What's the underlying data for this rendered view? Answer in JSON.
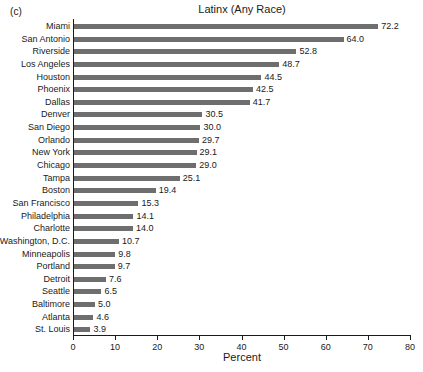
{
  "figure": {
    "panel_label": "(c)",
    "x_axis_title": "Percent"
  },
  "chart_data": {
    "type": "bar",
    "orientation": "horizontal",
    "title": "Latinx (Any Race)",
    "xlabel": "Percent",
    "ylabel": "",
    "xlim": [
      0,
      80
    ],
    "xticks": [
      0,
      10,
      20,
      30,
      40,
      50,
      60,
      70,
      80
    ],
    "xtick_labels": [
      "0",
      "10",
      "20",
      "30",
      "40",
      "50",
      "60",
      "70",
      "80"
    ],
    "grid": false,
    "legend": null,
    "bar_color": "#6e6e6e",
    "value_label_format": "one-decimal",
    "categories": [
      "Miami",
      "San Antonio",
      "Riverside",
      "Los Angeles",
      "Houston",
      "Phoenix",
      "Dallas",
      "Denver",
      "San Diego",
      "Orlando",
      "New York",
      "Chicago",
      "Tampa",
      "Boston",
      "San Francisco",
      "Philadelphia",
      "Charlotte",
      "Washington, D.C.",
      "Minneapolis",
      "Portland",
      "Detroit",
      "Seattle",
      "Baltimore",
      "Atlanta",
      "St. Louis"
    ],
    "values": [
      72.2,
      64.0,
      52.8,
      48.7,
      44.5,
      42.5,
      41.7,
      30.5,
      30.0,
      29.7,
      29.1,
      29.0,
      25.1,
      19.4,
      15.3,
      14.1,
      14.0,
      10.7,
      9.8,
      9.7,
      7.6,
      6.5,
      5.0,
      4.6,
      3.9
    ],
    "value_labels": [
      "72.2",
      "64.0",
      "52.8",
      "48.7",
      "44.5",
      "42.5",
      "41.7",
      "30.5",
      "30.0",
      "29.7",
      "29.1",
      "29.0",
      "25.1",
      "19.4",
      "15.3",
      "14.1",
      "14.0",
      "10.7",
      "9.8",
      "9.7",
      "7.6",
      "6.5",
      "5.0",
      "4.6",
      "3.9"
    ]
  }
}
